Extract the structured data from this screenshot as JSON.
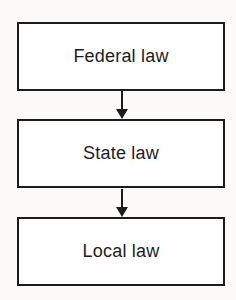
{
  "diagram": {
    "type": "flowchart",
    "orientation": "vertical",
    "nodes": [
      {
        "id": "federal",
        "label": "Federal law"
      },
      {
        "id": "state",
        "label": "State law"
      },
      {
        "id": "local",
        "label": "Local law"
      }
    ],
    "edges": [
      {
        "from": "federal",
        "to": "state",
        "direction": "down",
        "style": "solid-arrow"
      },
      {
        "from": "state",
        "to": "local",
        "direction": "down",
        "style": "solid-arrow"
      }
    ],
    "colors": {
      "background": "#fbfaf8",
      "box_fill": "#fefefe",
      "box_border": "#1c1c1c",
      "text": "#1d1d1d",
      "arrow": "#1c1c1c"
    }
  }
}
